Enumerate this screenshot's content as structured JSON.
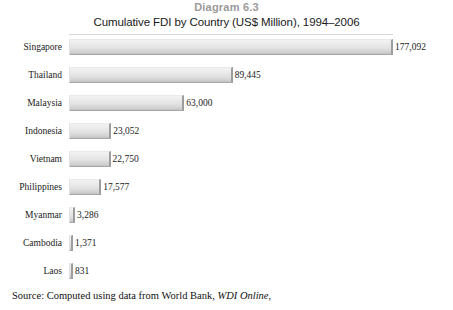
{
  "header": {
    "diagram_label": "Diagram 6.3"
  },
  "source": {
    "prefix": "Source:  Computed using data from World Bank, ",
    "italic": "WDI Online",
    "suffix": ","
  },
  "chart_data": {
    "type": "bar",
    "orientation": "horizontal",
    "title": "Cumulative FDI by Country (US$ Million), 1994–2006",
    "subtitle": "",
    "xlabel": "",
    "ylabel": "",
    "grid": false,
    "legend": "none",
    "xlim": [
      0,
      177092
    ],
    "categories": [
      "Singapore",
      "Thailand",
      "Malaysia",
      "Indonesia",
      "Vietnam",
      "Philippines",
      "Myanmar",
      "Cambodia",
      "Laos"
    ],
    "values": [
      177092,
      89445,
      63000,
      23052,
      22750,
      17577,
      3286,
      1371,
      831
    ],
    "value_labels": [
      "177,092",
      "89,445",
      "63,000",
      "23,052",
      "22,750",
      "17,577",
      "3,286",
      "1,371",
      "831"
    ],
    "bar_color": "#e3e3e3",
    "bar_edge_color": "#9d9d9d"
  }
}
